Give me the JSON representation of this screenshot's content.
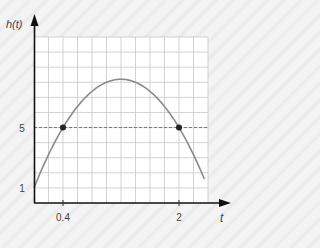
{
  "chart_data": {
    "type": "line",
    "title": "",
    "xlabel": "t",
    "ylabel": "h(t)",
    "xlim": [
      0,
      2.4
    ],
    "ylim": [
      0,
      11
    ],
    "grid": true,
    "x_step": 0.2,
    "y_step": 1,
    "x_ticks": [
      {
        "value": 0.4,
        "label": "0.4"
      },
      {
        "value": 2,
        "label": "2"
      }
    ],
    "y_ticks": [
      {
        "value": 1,
        "label": "1"
      },
      {
        "value": 5,
        "label": "5"
      }
    ],
    "series": [
      {
        "name": "h(t)",
        "equation": "h(t) = -5t^2 + 12t + 1",
        "x": [
          0,
          0.2,
          0.4,
          0.6,
          0.8,
          1.0,
          1.2,
          1.4,
          1.6,
          1.8,
          2.0,
          2.2,
          2.35
        ],
        "values": [
          1,
          3.2,
          5,
          6.4,
          7.4,
          8.0,
          8.2,
          8.0,
          7.4,
          6.4,
          5,
          3.2,
          1.6
        ],
        "color": "#888888"
      }
    ],
    "points": [
      {
        "x": 0.4,
        "y": 5
      },
      {
        "x": 2,
        "y": 5
      }
    ],
    "reference_lines": [
      {
        "type": "horizontal-dashed",
        "y": 5
      }
    ]
  },
  "labels": {
    "y_axis": "h(t)",
    "x_axis": "t",
    "tick_x_1": "0.4",
    "tick_x_2": "2",
    "tick_y_1": "1",
    "tick_y_5": "5"
  }
}
